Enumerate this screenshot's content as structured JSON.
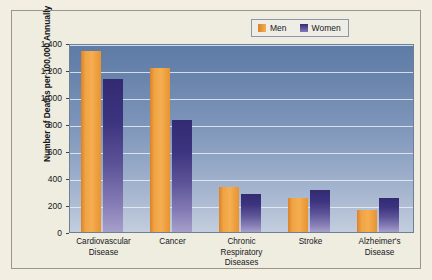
{
  "chart_data": {
    "type": "bar",
    "title": "",
    "subtitle": "",
    "xlabel": "",
    "ylabel": "Number of Deaths per 100,000 Annually",
    "ylim": [
      0,
      1400
    ],
    "ytick_step": 200,
    "ytick_labels": [
      "1,400",
      "1,200",
      "1,000",
      "800",
      "600",
      "400",
      "200",
      "0"
    ],
    "ytick_values": [
      1400,
      1200,
      1000,
      800,
      600,
      400,
      200,
      0
    ],
    "grid": true,
    "grid_axis": "y",
    "legend_position": "top-right",
    "categories": [
      "Cardiovascular Disease",
      "Cancer",
      "Chronic Respiratory Diseases",
      "Stroke",
      "Alzheimer's Disease"
    ],
    "category_label_lines": [
      [
        "Cardiovascular",
        "Disease"
      ],
      [
        "Cancer"
      ],
      [
        "Chronic",
        "Respiratory",
        "Diseases"
      ],
      [
        "Stroke"
      ],
      [
        "Alzheimer's",
        "Disease"
      ]
    ],
    "series": [
      {
        "name": "Men",
        "color": "#f0a443",
        "values": [
          1340,
          1215,
          335,
          255,
          165
        ]
      },
      {
        "name": "Women",
        "color": "#3d3480",
        "values": [
          1130,
          830,
          280,
          310,
          255
        ]
      }
    ]
  },
  "legend": {
    "entries": [
      {
        "label": "Men",
        "swatch": "men-swatch"
      },
      {
        "label": "Women",
        "swatch": "women-swatch"
      }
    ]
  }
}
